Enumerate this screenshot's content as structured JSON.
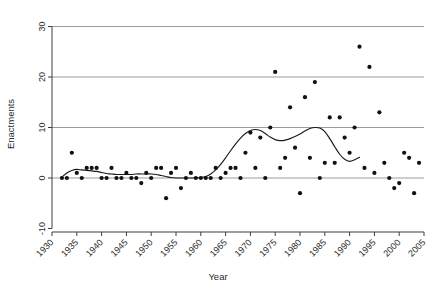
{
  "chart_data": {
    "type": "scatter",
    "title": "",
    "subtitle": "",
    "xlabel": "Year",
    "ylabel": "Enactments",
    "xlim": [
      1930,
      2005
    ],
    "ylim": [
      -10,
      30
    ],
    "xticks": [
      1930,
      1935,
      1940,
      1945,
      1950,
      1955,
      1960,
      1965,
      1970,
      1975,
      1980,
      1985,
      1990,
      1995,
      2000,
      2005
    ],
    "xtick_labels": [
      "1930",
      "1935",
      "1940",
      "1945",
      "1950",
      "1955",
      "1960",
      "1965",
      "1970",
      "1975",
      "1980",
      "1985",
      "1990",
      "1995",
      "2000",
      "2005"
    ],
    "yticks": [
      -10,
      0,
      10,
      20,
      30
    ],
    "ytick_labels": [
      "-10",
      "0",
      "10",
      "20",
      "30"
    ],
    "grid": "horizontal-gridlines-at-y-ticks",
    "legend": "none",
    "point_color": "#111111",
    "curve_color": "#1a1a1a",
    "grid_color": "#9b9b9b",
    "axis_color": "#3d3d3d",
    "series": [
      {
        "name": "Enactments",
        "marker": "filled-circle",
        "points": [
          [
            1932,
            0
          ],
          [
            1933,
            0
          ],
          [
            1934,
            5
          ],
          [
            1935,
            1
          ],
          [
            1936,
            0
          ],
          [
            1937,
            2
          ],
          [
            1938,
            2
          ],
          [
            1939,
            2
          ],
          [
            1940,
            0
          ],
          [
            1941,
            0
          ],
          [
            1942,
            2
          ],
          [
            1943,
            0
          ],
          [
            1944,
            0
          ],
          [
            1945,
            1
          ],
          [
            1946,
            0
          ],
          [
            1947,
            0
          ],
          [
            1948,
            -1
          ],
          [
            1949,
            1
          ],
          [
            1950,
            0
          ],
          [
            1951,
            2
          ],
          [
            1952,
            2
          ],
          [
            1953,
            -4
          ],
          [
            1954,
            1
          ],
          [
            1955,
            2
          ],
          [
            1956,
            -2
          ],
          [
            1957,
            0
          ],
          [
            1958,
            1
          ],
          [
            1959,
            0
          ],
          [
            1960,
            0
          ],
          [
            1961,
            0
          ],
          [
            1962,
            0
          ],
          [
            1963,
            2
          ],
          [
            1964,
            0
          ],
          [
            1965,
            1
          ],
          [
            1966,
            2
          ],
          [
            1967,
            2
          ],
          [
            1968,
            0
          ],
          [
            1969,
            5
          ],
          [
            1970,
            9
          ],
          [
            1971,
            2
          ],
          [
            1972,
            8
          ],
          [
            1973,
            0
          ],
          [
            1974,
            10
          ],
          [
            1975,
            21
          ],
          [
            1976,
            2
          ],
          [
            1977,
            4
          ],
          [
            1978,
            14
          ],
          [
            1979,
            6
          ],
          [
            1980,
            -3
          ],
          [
            1981,
            16
          ],
          [
            1982,
            4
          ],
          [
            1983,
            19
          ],
          [
            1984,
            0
          ],
          [
            1985,
            3
          ],
          [
            1986,
            12
          ],
          [
            1987,
            3
          ],
          [
            1988,
            12
          ],
          [
            1989,
            8
          ],
          [
            1990,
            5
          ],
          [
            1991,
            10
          ],
          [
            1992,
            26
          ],
          [
            1993,
            2
          ],
          [
            1994,
            22
          ],
          [
            1995,
            1
          ],
          [
            1996,
            13
          ],
          [
            1997,
            3
          ],
          [
            1998,
            0
          ],
          [
            1999,
            -2
          ],
          [
            2000,
            -1
          ],
          [
            2001,
            5
          ],
          [
            2002,
            4
          ],
          [
            2003,
            -3
          ],
          [
            2004,
            3
          ]
        ]
      }
    ],
    "trend": {
      "name": "smoothed-trend",
      "type": "loess-smooth",
      "points": [
        [
          1932,
          0.2
        ],
        [
          1933,
          1.0
        ],
        [
          1934,
          1.5
        ],
        [
          1935,
          1.7
        ],
        [
          1936,
          1.6
        ],
        [
          1937,
          1.5
        ],
        [
          1938,
          1.4
        ],
        [
          1939,
          1.3
        ],
        [
          1940,
          1.1
        ],
        [
          1941,
          0.9
        ],
        [
          1942,
          0.8
        ],
        [
          1943,
          0.7
        ],
        [
          1944,
          0.7
        ],
        [
          1945,
          0.7
        ],
        [
          1946,
          0.7
        ],
        [
          1947,
          0.8
        ],
        [
          1948,
          0.8
        ],
        [
          1949,
          0.8
        ],
        [
          1950,
          0.8
        ],
        [
          1951,
          0.7
        ],
        [
          1952,
          0.5
        ],
        [
          1953,
          0.3
        ],
        [
          1954,
          0.1
        ],
        [
          1955,
          0.0
        ],
        [
          1956,
          0.0
        ],
        [
          1957,
          0.0
        ],
        [
          1958,
          0.0
        ],
        [
          1959,
          0.0
        ],
        [
          1960,
          0.1
        ],
        [
          1961,
          0.3
        ],
        [
          1962,
          0.8
        ],
        [
          1963,
          1.6
        ],
        [
          1964,
          2.7
        ],
        [
          1965,
          4.0
        ],
        [
          1966,
          5.4
        ],
        [
          1967,
          6.7
        ],
        [
          1968,
          7.9
        ],
        [
          1969,
          8.8
        ],
        [
          1970,
          9.4
        ],
        [
          1971,
          9.6
        ],
        [
          1972,
          9.4
        ],
        [
          1973,
          8.8
        ],
        [
          1974,
          8.1
        ],
        [
          1975,
          7.6
        ],
        [
          1976,
          7.4
        ],
        [
          1977,
          7.5
        ],
        [
          1978,
          7.8
        ],
        [
          1979,
          8.2
        ],
        [
          1980,
          8.7
        ],
        [
          1981,
          9.3
        ],
        [
          1982,
          9.8
        ],
        [
          1983,
          10.0
        ],
        [
          1984,
          9.9
        ],
        [
          1985,
          9.2
        ],
        [
          1986,
          7.8
        ],
        [
          1987,
          6.2
        ],
        [
          1988,
          4.7
        ],
        [
          1989,
          3.7
        ],
        [
          1990,
          3.3
        ],
        [
          1991,
          3.6
        ],
        [
          1992,
          4.1
        ]
      ]
    }
  }
}
